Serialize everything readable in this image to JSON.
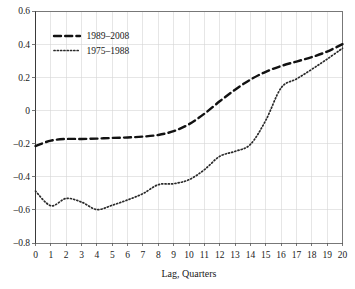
{
  "chart_data": {
    "type": "line",
    "title": "",
    "xlabel": "Lag, Quarters",
    "ylabel": "",
    "xlim": [
      0,
      20
    ],
    "ylim": [
      -0.8,
      0.6
    ],
    "grid": true,
    "legend_position": "top-left",
    "xticks": [
      "0",
      "1",
      "2",
      "3",
      "4",
      "5",
      "6",
      "7",
      "8",
      "9",
      "10",
      "11",
      "12",
      "13",
      "14",
      "15",
      "16",
      "17",
      "18",
      "19",
      "20"
    ],
    "yticks": [
      "0.6",
      "0.4",
      "0.2",
      "0",
      "–0.2",
      "–0.4",
      "–0.6",
      "–0.8"
    ],
    "ytick_values": [
      0.6,
      0.4,
      0.2,
      0,
      -0.2,
      -0.4,
      -0.6,
      -0.8
    ],
    "x": [
      0,
      1,
      2,
      3,
      4,
      5,
      6,
      7,
      8,
      9,
      10,
      11,
      12,
      13,
      14,
      15,
      16,
      17,
      18,
      19,
      20
    ],
    "series": [
      {
        "name": "1989–2008",
        "style": "dashed",
        "color": "#121212",
        "values": [
          -0.215,
          -0.182,
          -0.172,
          -0.172,
          -0.17,
          -0.166,
          -0.163,
          -0.158,
          -0.148,
          -0.125,
          -0.083,
          -0.02,
          0.055,
          0.125,
          0.186,
          0.233,
          0.268,
          0.295,
          0.322,
          0.355,
          0.4
        ]
      },
      {
        "name": "1975–1988",
        "style": "dotted",
        "color": "#2a2a2a",
        "values": [
          -0.487,
          -0.575,
          -0.531,
          -0.553,
          -0.598,
          -0.572,
          -0.54,
          -0.502,
          -0.448,
          -0.442,
          -0.418,
          -0.358,
          -0.277,
          -0.247,
          -0.205,
          -0.06,
          0.136,
          0.19,
          0.248,
          0.31,
          0.375
        ]
      }
    ]
  },
  "legend": {
    "entries": [
      {
        "label": "1989–2008"
      },
      {
        "label": "1975–1988"
      }
    ]
  },
  "axes": {
    "x_title": "Lag, Quarters"
  }
}
